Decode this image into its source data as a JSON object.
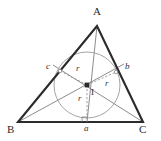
{
  "figure": {
    "background_color": "#ffffff",
    "width": 161,
    "height": 141,
    "colors": {
      "triangle_stroke": "#2b2b2b",
      "circle_stroke": "#9a9a9a",
      "bisector_stroke": "#6e6e6e",
      "radius_stroke": "#8a8a8a",
      "label_color": "#2b2b2b"
    },
    "vertices": [
      {
        "id": "A",
        "label": "A",
        "x": 97,
        "y": 26,
        "label_x": 93,
        "label_y": 6
      },
      {
        "id": "B",
        "label": "B",
        "x": 18,
        "y": 122,
        "label_x": 9,
        "label_y": 124
      },
      {
        "id": "C",
        "label": "C",
        "x": 143,
        "y": 122,
        "label_x": 140,
        "label_y": 124
      }
    ],
    "incenter": {
      "id": "I",
      "label": "I",
      "x": 87,
      "y": 85,
      "label_x": 91,
      "label_y": 89,
      "marker": "filled-square"
    },
    "incircle": {
      "center_x": 87,
      "center_y": 85,
      "radius": 33
    },
    "touch_points": [
      {
        "id": "a",
        "label": "a",
        "side": "BC",
        "x": 87,
        "y": 122,
        "label_x": 84,
        "label_y": 124
      },
      {
        "id": "c",
        "label": "c",
        "side": "AB",
        "x": 60,
        "y": 71,
        "label_x": 47,
        "label_y": 62
      },
      {
        "id": "b",
        "label": "b",
        "side": "AC",
        "x": 116,
        "y": 72,
        "label_x": 125,
        "label_y": 62
      }
    ],
    "radii": [
      {
        "id": "r-to-c",
        "label": "r",
        "from": "I",
        "to": "c",
        "label_x": 76,
        "label_y": 65,
        "style": "dashed"
      },
      {
        "id": "r-to-b",
        "label": "r",
        "from": "I",
        "to": "b",
        "label_x": 105,
        "label_y": 79,
        "style": "dashed"
      },
      {
        "id": "r-to-a",
        "label": "r",
        "from": "I",
        "to": "a",
        "label_x": 78,
        "label_y": 94,
        "style": "dashed"
      }
    ],
    "bisectors": [
      {
        "id": "bisector-from-A",
        "from": "A",
        "through": "I",
        "to_side": "BC"
      },
      {
        "id": "bisector-from-B",
        "from": "B",
        "through": "I",
        "to_side": "AC"
      },
      {
        "id": "bisector-from-C",
        "from": "C",
        "through": "I",
        "to_side": "AB"
      }
    ],
    "right_angle_mark": {
      "id": "right-angle-at-a",
      "x": 87,
      "y": 122,
      "size": 5
    }
  }
}
